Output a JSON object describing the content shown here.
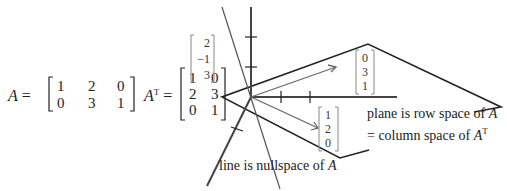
{
  "matrix_A": {
    "name": "A",
    "rows": [
      [
        "1",
        "2",
        "0"
      ],
      [
        "0",
        "3",
        "1"
      ]
    ]
  },
  "matrix_AT": {
    "name": "A",
    "superscript": "T",
    "rows": [
      [
        "1",
        "0"
      ],
      [
        "2",
        "3"
      ],
      [
        "0",
        "1"
      ]
    ]
  },
  "vectors": {
    "nullspace_vector": [
      "2",
      "−1",
      "3"
    ],
    "row1_vector": [
      "1",
      "2",
      "0"
    ],
    "row2_vector": [
      "0",
      "3",
      "1"
    ]
  },
  "labels": {
    "plane_line1": "plane is row space of ",
    "plane_line1_var": "A",
    "plane_line2": "= column space of ",
    "plane_line2_var": "A",
    "plane_line2_sup": "T",
    "line_prefix": "line is ",
    "line_text": "nullspace of ",
    "line_var": "A",
    "equals": "="
  },
  "colors": {
    "ink": "#222222",
    "axis": "#444444",
    "bracket": "#888888"
  }
}
